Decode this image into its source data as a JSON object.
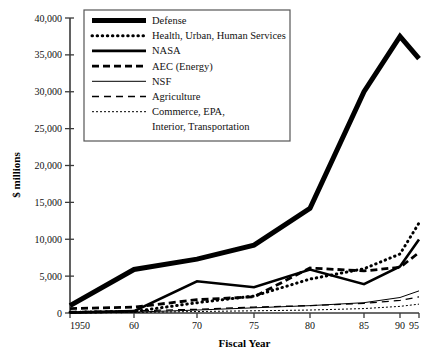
{
  "chart_data": {
    "type": "line",
    "title": "",
    "xlabel": "Fiscal Year",
    "ylabel": "$ millions",
    "grid": false,
    "legend_position": "top-center-inside",
    "x": [
      1950,
      1960,
      1970,
      1975,
      1980,
      1985,
      1990,
      1995
    ],
    "x_tick_labels": [
      "1950",
      "60",
      "70",
      "75",
      "80",
      "85",
      "90",
      "95"
    ],
    "y_tick_labels": [
      "0",
      "5,000",
      "10,000",
      "15,000",
      "20,000",
      "25,000",
      "30,000",
      "35,000",
      "40,000"
    ],
    "y_ticks": [
      0,
      5000,
      10000,
      15000,
      20000,
      25000,
      30000,
      35000,
      40000
    ],
    "ylim": [
      0,
      40000
    ],
    "xlim": [
      1950,
      1995
    ],
    "series": [
      {
        "name": "Defense",
        "style": "solid-very-thick",
        "values": [
          1000,
          5900,
          7300,
          9200,
          14200,
          30000,
          37500,
          34500
        ]
      },
      {
        "name": "Health, Urban, Human Services",
        "style": "dotted-thick",
        "values": [
          100,
          200,
          1400,
          2300,
          4600,
          6000,
          8000,
          12200
        ]
      },
      {
        "name": "NASA",
        "style": "solid-thick",
        "values": [
          50,
          250,
          4300,
          3500,
          5900,
          3900,
          6300,
          9950
        ]
      },
      {
        "name": "AEC (Energy)",
        "style": "dashed-thick",
        "values": [
          600,
          800,
          1800,
          2200,
          6100,
          5700,
          6200,
          8200
        ]
      },
      {
        "name": "NSF",
        "style": "solid-thin",
        "values": [
          20,
          120,
          400,
          700,
          1000,
          1400,
          2100,
          3000
        ]
      },
      {
        "name": "Agriculture",
        "style": "dashed-thin",
        "values": [
          200,
          300,
          500,
          800,
          1000,
          1300,
          1700,
          2200
        ]
      },
      {
        "name": "Commerce, EPA, Interior, Transportation",
        "style": "dotted-thin",
        "values": [
          30,
          80,
          200,
          300,
          400,
          600,
          900,
          1200
        ]
      }
    ],
    "legend_entries": [
      {
        "label": "Defense",
        "style": "solid-very-thick"
      },
      {
        "label": "Health, Urban, Human Services",
        "style": "dotted-thick"
      },
      {
        "label": "NASA",
        "style": "solid-thick"
      },
      {
        "label": "AEC (Energy)",
        "style": "dashed-thick"
      },
      {
        "label": "NSF",
        "style": "solid-thin"
      },
      {
        "label": "Agriculture",
        "style": "dashed-thin"
      },
      {
        "label": "Commerce, EPA,",
        "style": "dotted-thin"
      },
      {
        "label": "Interior, Transportation",
        "style": "none"
      }
    ],
    "colors": {
      "line": "#000000",
      "axis": "#3a3a3a",
      "text": "#111111",
      "background": "#ffffff",
      "legend_border": "#555555"
    }
  }
}
